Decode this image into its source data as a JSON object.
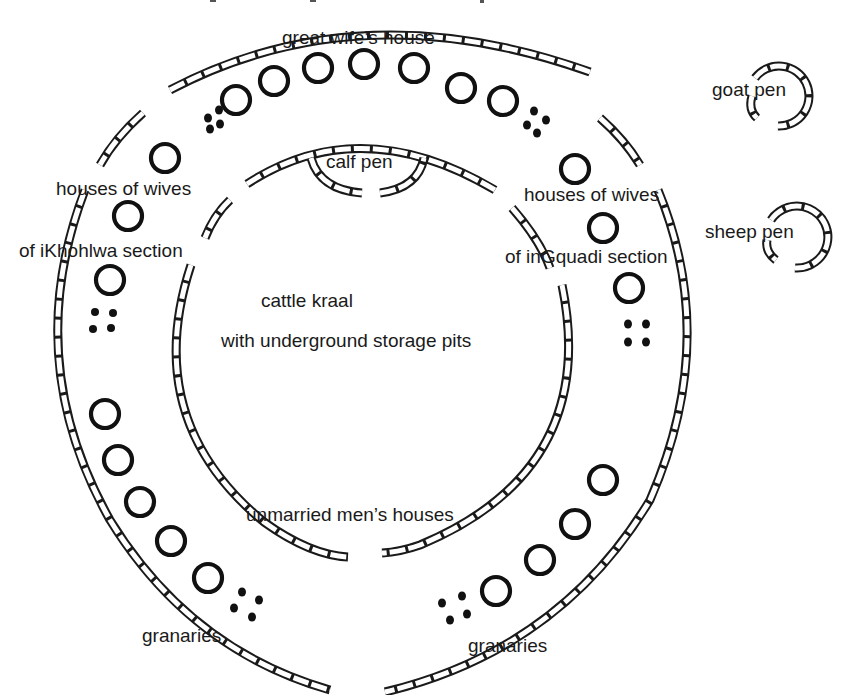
{
  "diagram": {
    "labels": {
      "great_wife": "great wife’s house",
      "calf_pen": "calf pen",
      "goat_pen": "goat pen",
      "sheep_pen": "sheep pen",
      "wives_left_1": "houses of wives",
      "wives_left_2": "of iKhohlwa section",
      "wives_right_1": "houses of wives",
      "wives_right_2": "of inGquadi section",
      "cattle_kraal_1": "cattle kraal",
      "cattle_kraal_2": "with underground storage pits",
      "unmarried": "unmarried men’s houses",
      "granaries_left": "granaries",
      "granaries_right": "granaries"
    },
    "counts": {
      "top_arc_houses": 8,
      "left_side_houses": 8,
      "right_side_houses": 3,
      "bottom_right_houses": 4,
      "granary_clusters": 6
    },
    "colors": {
      "ink": "#1a1a1a",
      "background": "#ffffff"
    }
  }
}
